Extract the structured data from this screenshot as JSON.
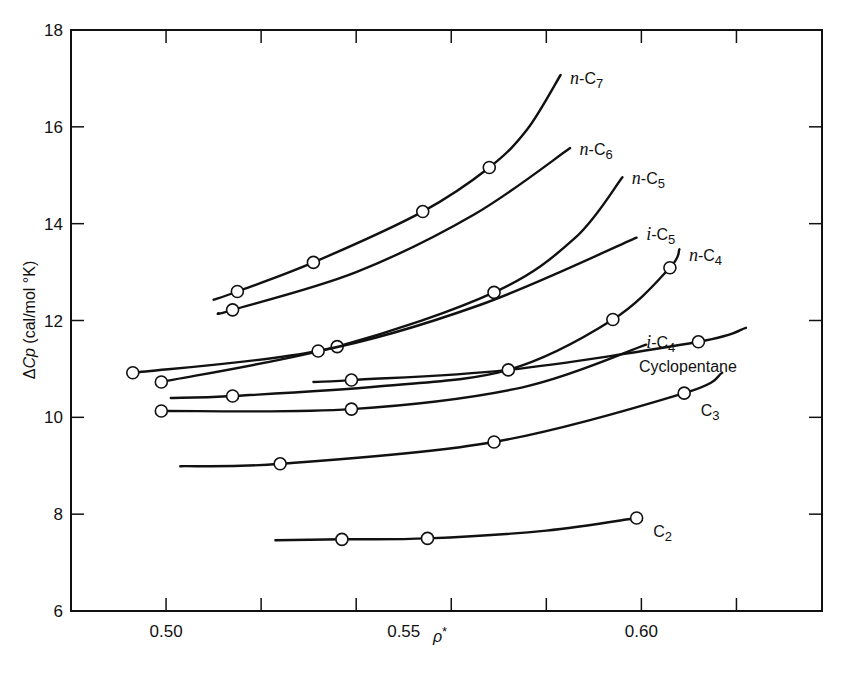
{
  "chart_data": {
    "type": "line",
    "title": "",
    "xlabel": "ρ*",
    "ylabel": "ΔCp (cal/mol °K)",
    "xlim": [
      0.48,
      0.638
    ],
    "ylim": [
      6,
      18
    ],
    "x_ticks": [
      0.5,
      0.52,
      0.54,
      0.56,
      0.58,
      0.6,
      0.62
    ],
    "x_tick_labels": [
      {
        "value": 0.5,
        "label": "0.50"
      },
      {
        "value": 0.55,
        "label": "0.55"
      },
      {
        "value": 0.6,
        "label": "0.60"
      }
    ],
    "y_ticks": [
      6,
      8,
      10,
      12,
      14,
      16,
      18
    ],
    "y_tick_labels": [
      "6",
      "8",
      "10",
      "12",
      "14",
      "16",
      "18"
    ],
    "grid": false,
    "legend": "inline labels at curve ends",
    "marker": "open-circle",
    "series": [
      {
        "name": "n-C7",
        "label_prefix": "n",
        "label_base": "-C",
        "label_sub": "7",
        "label_pos": [
          0.585,
          17.0
        ],
        "curve": [
          [
            0.51,
            12.43
          ],
          [
            0.515,
            12.6
          ],
          [
            0.531,
            13.2
          ],
          [
            0.554,
            14.25
          ],
          [
            0.568,
            15.16
          ],
          [
            0.576,
            15.95
          ],
          [
            0.583,
            17.07
          ]
        ],
        "points": [
          [
            0.515,
            12.6
          ],
          [
            0.531,
            13.2
          ],
          [
            0.554,
            14.25
          ],
          [
            0.568,
            15.16
          ]
        ]
      },
      {
        "name": "n-C6",
        "label_prefix": "n",
        "label_base": "-C",
        "label_sub": "6",
        "label_pos": [
          0.587,
          15.55
        ],
        "curve": [
          [
            0.511,
            12.15
          ],
          [
            0.514,
            12.22
          ],
          [
            0.54,
            13.0
          ],
          [
            0.565,
            14.2
          ],
          [
            0.585,
            15.56
          ]
        ],
        "points": [
          [
            0.514,
            12.22
          ]
        ]
      },
      {
        "name": "n-C5",
        "label_prefix": "n",
        "label_base": "-C",
        "label_sub": "5",
        "label_pos": [
          0.598,
          14.95
        ],
        "curve": [
          [
            0.499,
            10.73
          ],
          [
            0.536,
            11.46
          ],
          [
            0.569,
            12.58
          ],
          [
            0.586,
            13.7
          ],
          [
            0.596,
            14.96
          ]
        ],
        "points": [
          [
            0.499,
            10.73
          ],
          [
            0.536,
            11.46
          ],
          [
            0.569,
            12.58
          ]
        ]
      },
      {
        "name": "i-C5",
        "label_prefix": "i",
        "label_base": "-C",
        "label_sub": "5",
        "label_pos": [
          0.601,
          13.78
        ],
        "curve": [
          [
            0.493,
            10.92
          ],
          [
            0.532,
            11.37
          ],
          [
            0.566,
            12.32
          ],
          [
            0.599,
            13.71
          ]
        ],
        "points": [
          [
            0.493,
            10.92
          ],
          [
            0.532,
            11.37
          ]
        ]
      },
      {
        "name": "n-C4",
        "label_prefix": "n",
        "label_base": "-C",
        "label_sub": "4",
        "label_pos": [
          0.61,
          13.35
        ],
        "curve": [
          [
            0.501,
            10.4
          ],
          [
            0.514,
            10.44
          ],
          [
            0.545,
            10.64
          ],
          [
            0.572,
            10.98
          ],
          [
            0.594,
            12.02
          ],
          [
            0.606,
            13.09
          ],
          [
            0.608,
            13.47
          ]
        ],
        "points": [
          [
            0.514,
            10.44
          ],
          [
            0.594,
            12.02
          ],
          [
            0.606,
            13.09
          ]
        ]
      },
      {
        "name": "i-C4",
        "label_prefix": "i",
        "label_base": "-C",
        "label_sub": "4",
        "label_pos": [
          0.601,
          11.55
        ],
        "curve": [
          [
            0.499,
            10.13
          ],
          [
            0.539,
            10.17
          ],
          [
            0.575,
            10.62
          ],
          [
            0.601,
            11.5
          ]
        ],
        "points": [
          [
            0.499,
            10.13
          ],
          [
            0.539,
            10.17
          ]
        ]
      },
      {
        "name": "Cyclopentane",
        "label_prefix": "",
        "label_base": "Cyclopentane",
        "label_sub": "",
        "label_pos": [
          0.5995,
          11.05
        ],
        "curve": [
          [
            0.531,
            10.73
          ],
          [
            0.539,
            10.77
          ],
          [
            0.572,
            10.98
          ],
          [
            0.612,
            11.56
          ],
          [
            0.622,
            11.85
          ]
        ],
        "points": [
          [
            0.539,
            10.77
          ],
          [
            0.572,
            10.98
          ],
          [
            0.612,
            11.56
          ]
        ]
      },
      {
        "name": "C3",
        "label_prefix": "",
        "label_base": "C",
        "label_sub": "3",
        "label_pos": [
          0.6125,
          10.15
        ],
        "curve": [
          [
            0.503,
            8.99
          ],
          [
            0.524,
            9.04
          ],
          [
            0.569,
            9.49
          ],
          [
            0.609,
            10.5
          ],
          [
            0.617,
            10.92
          ]
        ],
        "points": [
          [
            0.524,
            9.04
          ],
          [
            0.569,
            9.49
          ],
          [
            0.609,
            10.5
          ]
        ]
      },
      {
        "name": "C2",
        "label_prefix": "",
        "label_base": "C",
        "label_sub": "2",
        "label_pos": [
          0.6025,
          7.65
        ],
        "curve": [
          [
            0.523,
            7.46
          ],
          [
            0.537,
            7.48
          ],
          [
            0.555,
            7.5
          ],
          [
            0.58,
            7.66
          ],
          [
            0.599,
            7.92
          ]
        ],
        "points": [
          [
            0.537,
            7.48
          ],
          [
            0.555,
            7.5
          ],
          [
            0.599,
            7.92
          ]
        ]
      }
    ]
  },
  "axes": {
    "x_title_main": "ρ",
    "x_title_sup": "*",
    "y_title_delta": "Δ",
    "y_title_var": "Cp",
    "y_title_units": " (cal/mol °K)"
  }
}
